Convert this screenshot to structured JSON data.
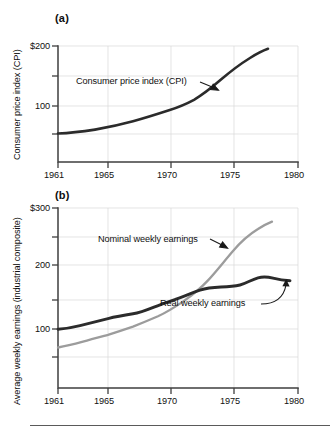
{
  "figure": {
    "background": "#ffffff",
    "bottom_rule": true
  },
  "colors": {
    "axis": "#3f3f3f",
    "grid": "#d8d8d8",
    "text": "#101010",
    "cpi_line": "#2b2b2b",
    "real_line": "#2b2b2b",
    "nominal_line": "#9c9c9c"
  },
  "panels": {
    "a": {
      "letter": "(a)",
      "ylabel": "Consumer price index (CPI)",
      "y_ticks": [
        {
          "value": 200,
          "label": "$200"
        },
        {
          "value": 150,
          "label": ""
        },
        {
          "value": 100,
          "label": "100"
        },
        {
          "value": 70,
          "label": ""
        }
      ],
      "x_ticks": [
        {
          "value": 1961,
          "label": "1961"
        },
        {
          "value": 1965,
          "label": "1965"
        },
        {
          "value": 1970,
          "label": "1970"
        },
        {
          "value": 1975,
          "label": "1975"
        },
        {
          "value": 1980,
          "label": "1980"
        }
      ],
      "annotation": "Consumer price index (CPI)"
    },
    "b": {
      "letter": "(b)",
      "ylabel": "Average weekly earnings (industrial composite)",
      "y_ticks": [
        {
          "value": 300,
          "label": "$300"
        },
        {
          "value": 250,
          "label": ""
        },
        {
          "value": 200,
          "label": "200"
        },
        {
          "value": 150,
          "label": ""
        },
        {
          "value": 100,
          "label": "100"
        },
        {
          "value": 70,
          "label": ""
        }
      ],
      "x_ticks": [
        {
          "value": 1961,
          "label": "1961"
        },
        {
          "value": 1965,
          "label": "1965"
        },
        {
          "value": 1970,
          "label": "1970"
        },
        {
          "value": 1975,
          "label": "1975"
        },
        {
          "value": 1980,
          "label": "1980"
        }
      ],
      "annotation_nominal": "Nominal weekly earnings",
      "annotation_real": "Real weekly earnings"
    }
  },
  "chart_data": [
    {
      "type": "line",
      "panel": "a",
      "title": "(a)",
      "xlabel": "",
      "ylabel": "Consumer price index (CPI)",
      "yscale": "log",
      "ylim": [
        55,
        210
      ],
      "xlim": [
        1961,
        1980
      ],
      "grid": true,
      "ytick_values": [
        200,
        150,
        100,
        70
      ],
      "ytick_labels": [
        "$200",
        "",
        "100",
        ""
      ],
      "xtick_values": [
        1961,
        1965,
        1970,
        1975,
        1980
      ],
      "xtick_labels": [
        "1961",
        "1965",
        "1970",
        "1975",
        "1980"
      ],
      "legend_position": "inline-annotation",
      "annotations": [
        {
          "text": "Consumer price index (CPI)",
          "points_to_x": 1973.5,
          "points_to_y": 131
        }
      ],
      "series": [
        {
          "name": "Consumer price index (CPI)",
          "color": "#2b2b2b",
          "x": [
            1961,
            1962,
            1963,
            1964,
            1965,
            1966,
            1967,
            1968,
            1969,
            1970,
            1971,
            1972,
            1973,
            1974,
            1975,
            1976,
            1977,
            1978
          ],
          "values": [
            73,
            74,
            75,
            76,
            78,
            80,
            83,
            86,
            90,
            94,
            97,
            102,
            110,
            122,
            135,
            145,
            157,
            172
          ]
        }
      ]
    },
    {
      "type": "line",
      "panel": "b",
      "title": "(b)",
      "xlabel": "",
      "ylabel": "Average weekly earnings (industrial composite)",
      "yscale": "log",
      "ylim": [
        58,
        320
      ],
      "xlim": [
        1961,
        1980
      ],
      "grid": true,
      "ytick_values": [
        300,
        250,
        200,
        150,
        100,
        70
      ],
      "ytick_labels": [
        "$300",
        "",
        "200",
        "",
        "100",
        ""
      ],
      "xtick_values": [
        1961,
        1965,
        1970,
        1975,
        1980
      ],
      "xtick_labels": [
        "1961",
        "1965",
        "1970",
        "1975",
        "1980"
      ],
      "legend_position": "inline-annotation",
      "annotations": [
        {
          "text": "Nominal weekly earnings",
          "points_to_x": 1974.2,
          "points_to_y": 205
        },
        {
          "text": "Real weekly earnings",
          "points_to_x": 1977.4,
          "points_to_y": 150
        }
      ],
      "series": [
        {
          "name": "Nominal weekly earnings",
          "color": "#9c9c9c",
          "x": [
            1961,
            1962,
            1963,
            1964,
            1965,
            1966,
            1967,
            1968,
            1969,
            1970,
            1971,
            1972,
            1973,
            1974,
            1975,
            1976,
            1977,
            1978
          ],
          "values": [
            74,
            77,
            80,
            83,
            87,
            92,
            98,
            105,
            112,
            121,
            132,
            144,
            158,
            180,
            205,
            228,
            248,
            262
          ]
        },
        {
          "name": "Real weekly earnings",
          "color": "#2b2b2b",
          "x": [
            1961,
            1962,
            1963,
            1964,
            1965,
            1966,
            1967,
            1968,
            1969,
            1970,
            1971,
            1972,
            1973,
            1974,
            1975,
            1976,
            1977,
            1978
          ],
          "values": [
            102,
            104,
            107,
            109,
            112,
            115,
            118,
            122,
            124,
            129,
            136,
            141,
            143,
            147,
            148,
            152,
            157,
            155
          ]
        }
      ]
    }
  ]
}
